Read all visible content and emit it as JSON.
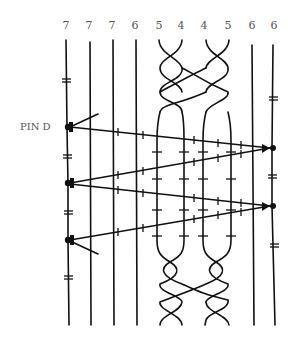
{
  "diagram": {
    "type": "bobbin-lace-style thread diagram",
    "column_labels": [
      "7",
      "7",
      "7",
      "6",
      "5",
      "4",
      "4",
      "5",
      "6",
      "6"
    ],
    "pin_label": "PIN D",
    "colors": {
      "thread": "#111111",
      "label": "#555555",
      "background": "#ffffff"
    },
    "elements": {
      "straight_threads_left": 4,
      "braids": 2,
      "straight_threads_right": 2,
      "pins_left": 3,
      "pins_right": 2,
      "zigzag_weaver_passes": 4
    }
  }
}
